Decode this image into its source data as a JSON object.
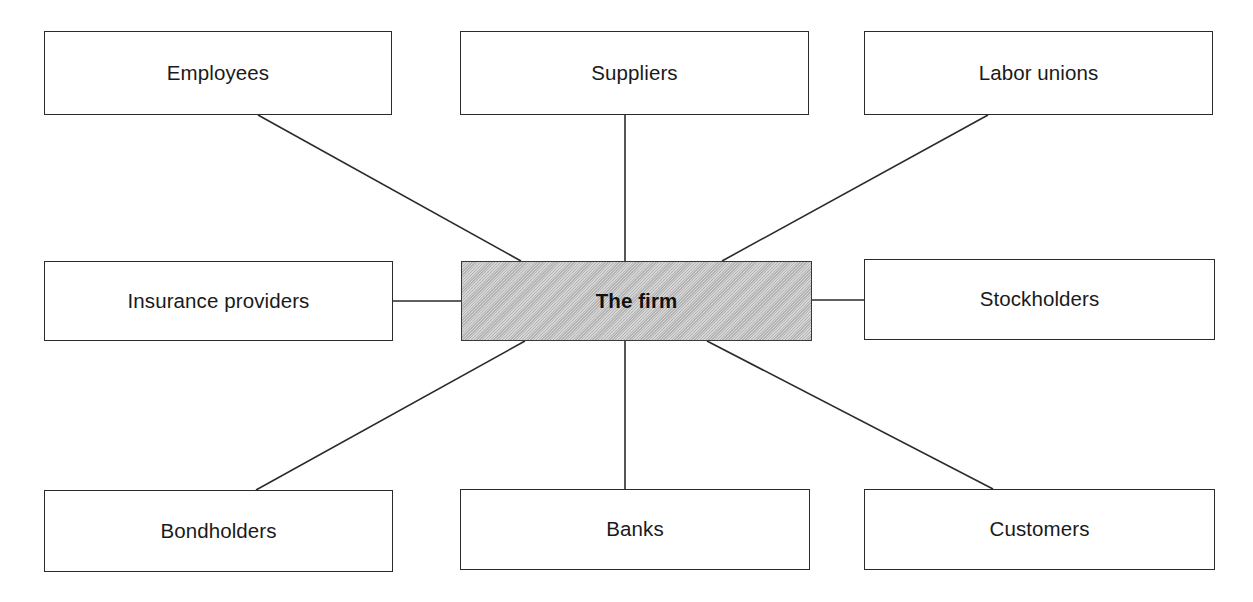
{
  "diagram": {
    "type": "hub-and-spoke",
    "background_color": "#ffffff",
    "line_color": "#2b2b2b",
    "central_fill_color": "#bebebe",
    "node_fill_color": "#ffffff",
    "central": {
      "label": "The firm",
      "x": 461,
      "y": 261,
      "width": 351,
      "height": 80
    },
    "nodes": [
      {
        "id": "employees",
        "label": "Employees",
        "x": 44,
        "y": 31,
        "width": 348,
        "height": 84
      },
      {
        "id": "suppliers",
        "label": "Suppliers",
        "x": 460,
        "y": 31,
        "width": 349,
        "height": 84
      },
      {
        "id": "labor-unions",
        "label": "Labor unions",
        "x": 864,
        "y": 31,
        "width": 349,
        "height": 84
      },
      {
        "id": "insurance-providers",
        "label": "Insurance providers",
        "x": 44,
        "y": 261,
        "width": 349,
        "height": 80
      },
      {
        "id": "stockholders",
        "label": "Stockholders",
        "x": 864,
        "y": 259,
        "width": 351,
        "height": 81
      },
      {
        "id": "bondholders",
        "label": "Bondholders",
        "x": 44,
        "y": 490,
        "width": 349,
        "height": 82
      },
      {
        "id": "banks",
        "label": "Banks",
        "x": 460,
        "y": 489,
        "width": 350,
        "height": 81
      },
      {
        "id": "customers",
        "label": "Customers",
        "x": 864,
        "y": 489,
        "width": 351,
        "height": 81
      }
    ],
    "connectors": [
      {
        "id": "employees-to-firm",
        "from": "employees",
        "to": "central",
        "x1": 258,
        "y1": 115,
        "x2": 521,
        "y2": 261
      },
      {
        "id": "suppliers-to-firm",
        "from": "suppliers",
        "to": "central",
        "x1": 625,
        "y1": 115,
        "x2": 625,
        "y2": 261
      },
      {
        "id": "labor-unions-to-firm",
        "from": "labor-unions",
        "to": "central",
        "x1": 988,
        "y1": 115,
        "x2": 722,
        "y2": 261
      },
      {
        "id": "insurance-providers-to-firm",
        "from": "insurance-providers",
        "to": "central",
        "x1": 393,
        "y1": 301,
        "x2": 461,
        "y2": 301
      },
      {
        "id": "firm-to-stockholders",
        "from": "central",
        "to": "stockholders",
        "x1": 812,
        "y1": 300,
        "x2": 864,
        "y2": 300
      },
      {
        "id": "firm-to-bondholders",
        "from": "central",
        "to": "bondholders",
        "x1": 525,
        "y1": 341,
        "x2": 256,
        "y2": 490
      },
      {
        "id": "firm-to-banks",
        "from": "central",
        "to": "banks",
        "x1": 625,
        "y1": 341,
        "x2": 625,
        "y2": 489
      },
      {
        "id": "firm-to-customers",
        "from": "central",
        "to": "customers",
        "x1": 707,
        "y1": 341,
        "x2": 993,
        "y2": 489
      }
    ]
  }
}
